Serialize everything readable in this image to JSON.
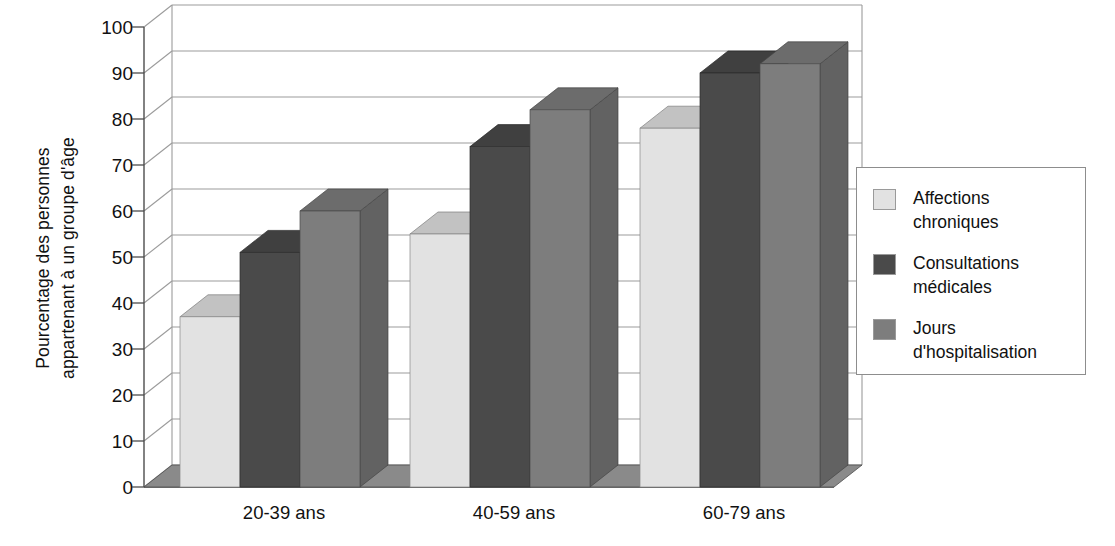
{
  "chart_data": {
    "type": "bar",
    "title": "",
    "subtitle": "",
    "xlabel": "",
    "ylabel": "Pourcentage des personnes appartenant à un groupe d'âge",
    "ylabel_lines": [
      "Pourcentage des personnes",
      "appartenant à un groupe d'âge"
    ],
    "categories": [
      "20-39 ans",
      "40-59 ans",
      "60-79 ans"
    ],
    "series": [
      {
        "name": "Affections chroniques",
        "values": [
          37,
          55,
          78
        ],
        "color": "#e2e2e2"
      },
      {
        "name": "Consultations médicales",
        "values": [
          51,
          74,
          90
        ],
        "color": "#4a4a4a"
      },
      {
        "name": "Jours d'hospitalisation",
        "values": [
          60,
          82,
          92
        ],
        "color": "#7d7d7d"
      }
    ],
    "ylim": [
      0,
      100
    ],
    "ytick_labels": [
      "0",
      "10",
      "20",
      "30",
      "40",
      "50",
      "60",
      "70",
      "80",
      "90",
      "100"
    ],
    "ytick_values": [
      0,
      10,
      20,
      30,
      40,
      50,
      60,
      70,
      80,
      90,
      100
    ],
    "grid": true,
    "grid_axis": "y",
    "legend_position": "right",
    "style_3d": true
  },
  "legend": {
    "items": [
      {
        "label": "Affections\nchroniques",
        "color": "#e2e2e2"
      },
      {
        "label": "Consultations\nmédicales",
        "color": "#4a4a4a"
      },
      {
        "label": "Jours\nd'hospitalisation",
        "color": "#7d7d7d"
      }
    ]
  },
  "colors": {
    "background": "#ffffff",
    "axis": "#4d4d4d",
    "grid": "#9b9b9b",
    "text": "#111111",
    "floor": "#8a8a8a",
    "series_light": "#e2e2e2",
    "series_dark": "#4a4a4a",
    "series_medium": "#7d7d7d"
  }
}
